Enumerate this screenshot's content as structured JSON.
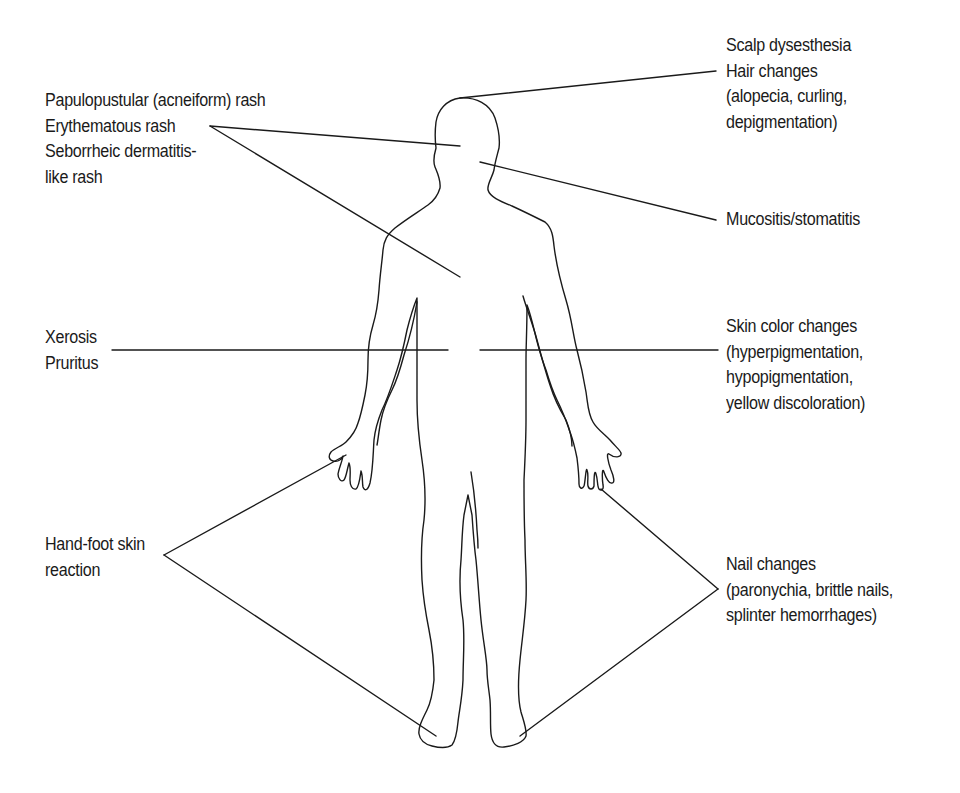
{
  "figure": {
    "type": "body-outline-annotation",
    "line_color": "#1a1a1a",
    "background": "#ffffff"
  },
  "labels": {
    "rash": {
      "lines": [
        "Papulopustular (acneiform) rash",
        "Erythematous rash",
        "Seborrheic dermatitis-",
        "like rash"
      ],
      "targets": [
        "face",
        "chest"
      ]
    },
    "scalp": {
      "lines": [
        "Scalp dysesthesia",
        "Hair changes",
        "(alopecia, curling,",
        "depigmentation)"
      ],
      "targets": [
        "scalp"
      ]
    },
    "mucositis": {
      "lines": [
        "Mucositis/stomatitis"
      ],
      "targets": [
        "mouth"
      ]
    },
    "xerosis": {
      "lines": [
        "Xerosis",
        "Pruritus"
      ],
      "targets": [
        "torso"
      ]
    },
    "skin_color": {
      "lines": [
        "Skin color changes",
        "(hyperpigmentation,",
        "hypopigmentation,",
        "yellow discoloration)"
      ],
      "targets": [
        "torso"
      ]
    },
    "hand_foot": {
      "lines": [
        "Hand-foot skin",
        "reaction"
      ],
      "targets": [
        "right hand",
        "right foot"
      ]
    },
    "nail": {
      "lines": [
        "Nail changes",
        "(paronychia, brittle nails,",
        "splinter hemorrhages)"
      ],
      "targets": [
        "left fingers",
        "left foot"
      ]
    }
  }
}
